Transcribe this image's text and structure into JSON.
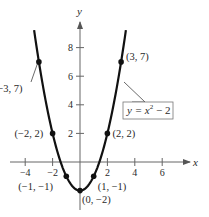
{
  "chart_data": {
    "type": "line",
    "title": "",
    "equation": "y = x² − 2",
    "equation_parts": {
      "lhs": "y = x",
      "exp": "2",
      "rhs": " − 2"
    },
    "xlabel": "x",
    "ylabel": "y",
    "xlim": [
      -5,
      7
    ],
    "ylim": [
      -2.5,
      10
    ],
    "grid": false,
    "legend": "none",
    "x_ticks": [
      -4,
      -2,
      2,
      4,
      6
    ],
    "x_tick_labels": [
      "−4",
      "−2",
      "2",
      "4",
      "6"
    ],
    "y_ticks": [
      2,
      4,
      6,
      8
    ],
    "y_tick_labels": [
      "2",
      "4",
      "6",
      "8"
    ],
    "series": [
      {
        "name": "y = x^2 - 2",
        "function": "x^2 - 2",
        "domain": [
          -3.35,
          3.35
        ],
        "color": "#111111"
      }
    ],
    "points": [
      {
        "x": -3,
        "y": 7,
        "label": "(−3, 7)"
      },
      {
        "x": -2,
        "y": 2,
        "label": "(−2, 2)"
      },
      {
        "x": -1,
        "y": -1,
        "label": "(−1, −1)"
      },
      {
        "x": 0,
        "y": -2,
        "label": "(0, −2)"
      },
      {
        "x": 1,
        "y": -1,
        "label": "(1, −1)"
      },
      {
        "x": 2,
        "y": 2,
        "label": "(2, 2)"
      },
      {
        "x": 3,
        "y": 7,
        "label": "(3, 7)"
      }
    ]
  },
  "colors": {
    "curve": "#111111",
    "axis": "#555555",
    "text": "#2a2a2a",
    "background": "#ffffff"
  }
}
